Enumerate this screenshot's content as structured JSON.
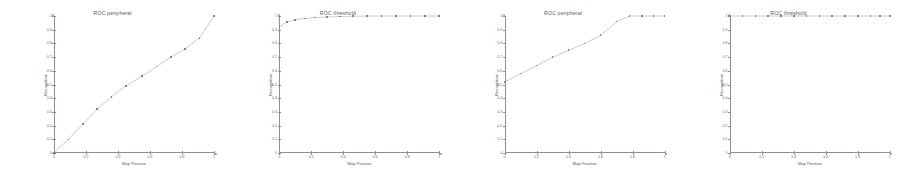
{
  "figure": {
    "background_color": "#ffffff",
    "line_color": "#9aa0ad",
    "marker_color": "#7d8492",
    "axis_color": "#8890a0",
    "text_color": "#5a5a68"
  },
  "chart_data": [
    {
      "type": "line",
      "title": "ROC peripheral",
      "xlabel": "Map Position",
      "ylabel": "Recognition",
      "xlim": [
        0,
        1
      ],
      "ylim": [
        0,
        1
      ],
      "grid": false,
      "legend": null,
      "xticks": [
        "0",
        "0.2",
        "0.4",
        "0.6",
        "0.8",
        "1"
      ],
      "xtick_values": [
        0,
        0.2,
        0.4,
        0.6,
        0.8,
        1
      ],
      "yticks": [
        "0",
        "0.1",
        "0.2",
        "0.3",
        "0.4",
        "0.5",
        "0.6",
        "0.7",
        "0.8",
        "0.9",
        "1"
      ],
      "ytick_values": [
        0,
        0.1,
        0.2,
        0.3,
        0.4,
        0.5,
        0.6,
        0.7,
        0.8,
        0.9,
        1
      ],
      "x": [
        0,
        0.09,
        0.18,
        0.27,
        0.36,
        0.45,
        0.55,
        0.64,
        0.73,
        0.82,
        0.91,
        1
      ],
      "y": [
        0,
        0.1,
        0.21,
        0.32,
        0.41,
        0.49,
        0.56,
        0.63,
        0.7,
        0.76,
        0.84,
        1
      ]
    },
    {
      "type": "line",
      "title": "ROC threshold",
      "xlabel": "Map Position",
      "ylabel": "Recognition",
      "xlim": [
        0,
        1
      ],
      "ylim": [
        0,
        1
      ],
      "grid": false,
      "legend": null,
      "xticks": [
        "0",
        "0.2",
        "0.4",
        "0.6",
        "0.8",
        "1"
      ],
      "xtick_values": [
        0,
        0.2,
        0.4,
        0.6,
        0.8,
        1
      ],
      "yticks": [
        "0",
        "0.1",
        "0.2",
        "0.3",
        "0.4",
        "0.5",
        "0.6",
        "0.7",
        "0.8",
        "0.9",
        "1"
      ],
      "ytick_values": [
        0,
        0.1,
        0.2,
        0.3,
        0.4,
        0.5,
        0.6,
        0.7,
        0.8,
        0.9,
        1
      ],
      "x": [
        0,
        0.05,
        0.1,
        0.16,
        0.22,
        0.3,
        0.38,
        0.46,
        0.55,
        0.64,
        0.73,
        0.82,
        0.91,
        1
      ],
      "y": [
        0.92,
        0.955,
        0.972,
        0.982,
        0.988,
        0.993,
        0.996,
        0.998,
        0.999,
        1,
        1,
        1,
        1,
        1
      ]
    },
    {
      "type": "line",
      "title": "ROC peripheral",
      "xlabel": "Map Position",
      "ylabel": "Recognition",
      "xlim": [
        0,
        1
      ],
      "ylim": [
        0,
        1
      ],
      "grid": false,
      "legend": null,
      "xticks": [
        "0",
        "0.2",
        "0.4",
        "0.6",
        "0.8",
        "1"
      ],
      "xtick_values": [
        0,
        0.2,
        0.4,
        0.6,
        0.8,
        1
      ],
      "yticks": [
        "0",
        "0.1",
        "0.2",
        "0.3",
        "0.4",
        "0.5",
        "0.6",
        "0.7",
        "0.8",
        "0.9",
        "1"
      ],
      "ytick_values": [
        0,
        0.1,
        0.2,
        0.3,
        0.4,
        0.5,
        0.6,
        0.7,
        0.8,
        0.9,
        1
      ],
      "x": [
        0,
        0.1,
        0.2,
        0.3,
        0.4,
        0.5,
        0.6,
        0.7,
        0.78,
        0.86,
        0.93,
        1
      ],
      "y": [
        0.52,
        0.58,
        0.64,
        0.7,
        0.75,
        0.8,
        0.86,
        0.96,
        1,
        1,
        1,
        1
      ]
    },
    {
      "type": "line",
      "title": "ROC threshold",
      "xlabel": "Map Position",
      "ylabel": "Recognition",
      "xlim": [
        0,
        1
      ],
      "ylim": [
        0,
        1
      ],
      "grid": false,
      "legend": null,
      "xticks": [
        "0",
        "0.2",
        "0.4",
        "0.6",
        "0.8",
        "1"
      ],
      "xtick_values": [
        0,
        0.2,
        0.4,
        0.6,
        0.8,
        1
      ],
      "yticks": [
        "0",
        "0.1",
        "0.2",
        "0.3",
        "0.4",
        "0.5",
        "0.6",
        "0.7",
        "0.8",
        "0.9",
        "1"
      ],
      "ytick_values": [
        0,
        0.1,
        0.2,
        0.3,
        0.4,
        0.5,
        0.6,
        0.7,
        0.8,
        0.9,
        1
      ],
      "x": [
        0,
        0.08,
        0.16,
        0.24,
        0.32,
        0.4,
        0.48,
        0.56,
        0.64,
        0.72,
        0.8,
        0.88,
        0.94,
        1
      ],
      "y": [
        1,
        1,
        1,
        1,
        1,
        1,
        1,
        1,
        1,
        1,
        1,
        1,
        1,
        1
      ]
    }
  ]
}
